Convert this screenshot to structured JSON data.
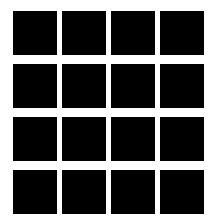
{
  "figure": {
    "title": "Grid of black squares",
    "kind": "grid-pattern",
    "canvas": {
      "width_px": 216,
      "height_px": 218,
      "background_color": "#ffffff"
    },
    "grid": {
      "rows": 4,
      "columns": 4,
      "cell_count": 16,
      "cell_color": "#000000",
      "cell_width_px": 44,
      "cell_height_px": 44,
      "column_gap_px": 5,
      "row_gap_px": 9,
      "offset_left_px": 13,
      "offset_top_px": 11,
      "total_width_px": 190,
      "total_height_px": 195
    },
    "cells": [
      {
        "row": 1,
        "column": 1,
        "color": "#000000"
      },
      {
        "row": 1,
        "column": 2,
        "color": "#000000"
      },
      {
        "row": 1,
        "column": 3,
        "color": "#000000"
      },
      {
        "row": 1,
        "column": 4,
        "color": "#000000"
      },
      {
        "row": 2,
        "column": 1,
        "color": "#000000"
      },
      {
        "row": 2,
        "column": 2,
        "color": "#000000"
      },
      {
        "row": 2,
        "column": 3,
        "color": "#000000"
      },
      {
        "row": 2,
        "column": 4,
        "color": "#000000"
      },
      {
        "row": 3,
        "column": 1,
        "color": "#000000"
      },
      {
        "row": 3,
        "column": 2,
        "color": "#000000"
      },
      {
        "row": 3,
        "column": 3,
        "color": "#000000"
      },
      {
        "row": 3,
        "column": 4,
        "color": "#000000"
      },
      {
        "row": 4,
        "column": 1,
        "color": "#000000"
      },
      {
        "row": 4,
        "column": 2,
        "color": "#000000"
      },
      {
        "row": 4,
        "column": 3,
        "color": "#000000"
      },
      {
        "row": 4,
        "column": 4,
        "color": "#000000"
      }
    ]
  }
}
